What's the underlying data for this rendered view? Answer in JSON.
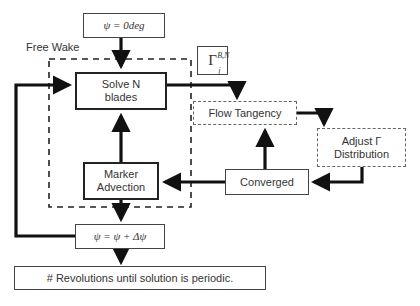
{
  "diagram": {
    "type": "flowchart",
    "group_label": "Free Wake",
    "nodes": {
      "start": "ψ = 0deg",
      "solve_line1": "Solve N",
      "solve_line2": "blades",
      "gamma_base": "Γ",
      "gamma_sub": "j",
      "gamma_sup": "B,N",
      "flow_tangency": "Flow Tangency",
      "adjust_line1": "Adjust Γ",
      "adjust_line2": "Distribution",
      "converged": "Converged",
      "marker_line1": "Marker",
      "marker_line2": "Advection",
      "increment": "ψ = ψ + Δψ",
      "revolutions": "# Revolutions until solution is periodic."
    },
    "edges": [
      {
        "from": "start",
        "to": "solve"
      },
      {
        "from": "solve",
        "to": "flow_tangency"
      },
      {
        "from": "flow_tangency",
        "to": "adjust"
      },
      {
        "from": "adjust",
        "to": "converged"
      },
      {
        "from": "converged",
        "to": "flow_tangency"
      },
      {
        "from": "converged",
        "to": "marker"
      },
      {
        "from": "marker",
        "to": "solve"
      },
      {
        "from": "marker",
        "to": "increment"
      },
      {
        "from": "increment",
        "to": "solve"
      },
      {
        "from": "increment",
        "to": "revolutions"
      }
    ]
  }
}
